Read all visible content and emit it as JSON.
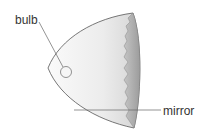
{
  "diagram": {
    "labels": {
      "bulb": "bulb",
      "mirror": "mirror"
    },
    "colors": {
      "outline": "#555555",
      "body_light": "#f4f4f4",
      "body_shade": "#d0d0d0",
      "inner_rim": "#a8a8a8",
      "leader": "#666666"
    }
  }
}
